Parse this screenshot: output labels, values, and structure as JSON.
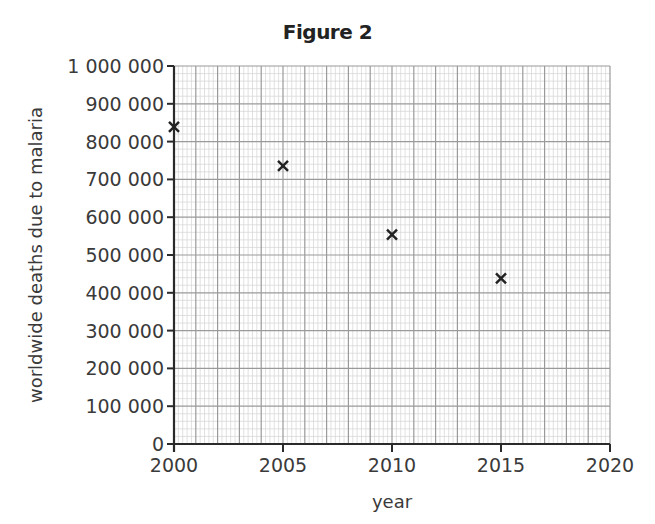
{
  "figure": {
    "title": "Figure 2"
  },
  "chart_data": {
    "type": "scatter",
    "title": "Figure 2",
    "xlabel": "year",
    "ylabel": "worldwide deaths due to malaria",
    "xlim": [
      2000,
      2020
    ],
    "ylim": [
      0,
      1000000
    ],
    "x_ticks": [
      2000,
      2005,
      2010,
      2015,
      2020
    ],
    "x_tick_labels": [
      "2000",
      "2005",
      "2010",
      "2015",
      "2020"
    ],
    "y_ticks": [
      0,
      100000,
      200000,
      300000,
      400000,
      500000,
      600000,
      700000,
      800000,
      900000,
      1000000
    ],
    "y_tick_labels": [
      "0",
      "100 000",
      "200 000",
      "300 000",
      "400 000",
      "500 000",
      "600 000",
      "700 000",
      "800 000",
      "900 000",
      "1 000 000"
    ],
    "grid": true,
    "grid_style": "graph paper (major every 1 year / 100 000, minor every 0.2 year / 20 000)",
    "marker": "x",
    "legend": null,
    "series": [
      {
        "name": "worldwide deaths due to malaria",
        "x": [
          2000,
          2005,
          2010,
          2015
        ],
        "y": [
          839000,
          736000,
          554000,
          438000
        ]
      }
    ]
  },
  "colors": {
    "minor_grid": "#d4d4d4",
    "major_grid": "#9a9a9a",
    "axis": "#2a2a2a",
    "marker": "#222222",
    "text": "#3a3a3a"
  }
}
